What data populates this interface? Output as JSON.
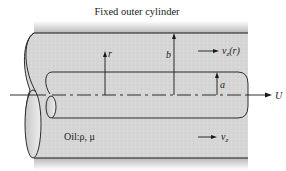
{
  "diagram": {
    "title": "Fixed outer cylinder",
    "labels": {
      "r": "r",
      "b": "b",
      "a": "a",
      "U": "U",
      "vz_r_main": "v",
      "vz_r_sub": "z",
      "vz_r_arg": "(r)",
      "vz_main": "v",
      "vz_sub": "z",
      "fluid": "Oil:ρ, μ"
    },
    "colors": {
      "fill": "#d4d4d4",
      "stroke": "#1a1a1a",
      "shadow": "#bdbdbd",
      "background": "#ffffff"
    }
  }
}
